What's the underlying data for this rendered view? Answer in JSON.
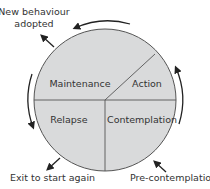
{
  "diagram": {
    "colors": {
      "segment_fill": "#d9dadb",
      "line": "#444444",
      "text": "#333333",
      "background": "#ffffff"
    },
    "segments": [
      {
        "id": "maintenance",
        "label": "Maintenance"
      },
      {
        "id": "action",
        "label": "Action"
      },
      {
        "id": "relapse",
        "label": "Relapse"
      },
      {
        "id": "contemplation",
        "label": "Contemplation"
      }
    ],
    "external_labels": {
      "new_behaviour_line1": "New behaviour",
      "new_behaviour_line2": "adopted",
      "exit": "Exit to start again",
      "precontemplation": "Pre-contemplation"
    },
    "arrows": [
      {
        "id": "top-arc",
        "direction": "counter-clockwise"
      },
      {
        "id": "right-arc",
        "direction": "upward"
      },
      {
        "id": "left-arc",
        "direction": "downward"
      },
      {
        "id": "exit-arrow",
        "direction": "outward-bottom-left"
      },
      {
        "id": "new-behaviour-arrow",
        "direction": "outward-top-left"
      },
      {
        "id": "precontemplation-arrow",
        "direction": "inward-top-left"
      }
    ]
  }
}
